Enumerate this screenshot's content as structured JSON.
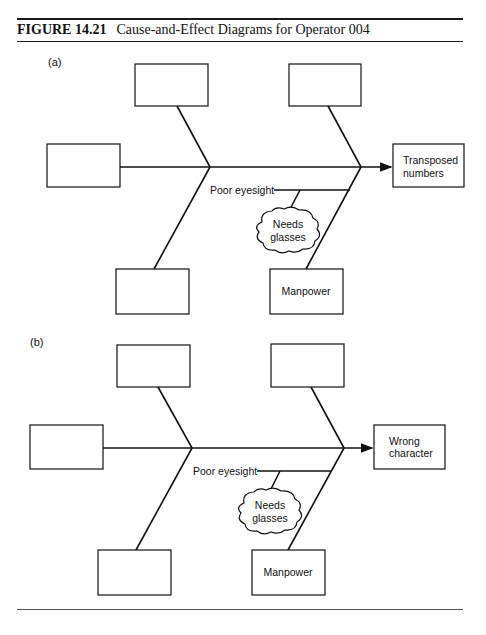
{
  "figure": {
    "number": "FIGURE 14.21",
    "caption": "Cause-and-Effect Diagrams for Operator 004"
  },
  "diagrams": [
    {
      "panel_label": "(a)",
      "effect": [
        "Transposed",
        "numbers"
      ],
      "cause_boxes": [
        "",
        "",
        "",
        "",
        "Manpower"
      ],
      "sub_cause": "Poor eyesight",
      "root_cause": [
        "Needs",
        "glasses"
      ]
    },
    {
      "panel_label": "(b)",
      "effect": [
        "Wrong",
        "character"
      ],
      "cause_boxes": [
        "",
        "",
        "",
        "",
        "Manpower"
      ],
      "sub_cause": "Poor eyesight",
      "root_cause": [
        "Needs",
        "glasses"
      ]
    }
  ]
}
